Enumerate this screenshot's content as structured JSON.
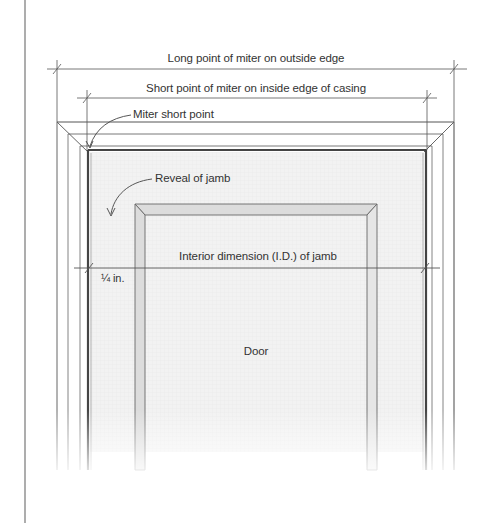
{
  "diagram": {
    "labels": {
      "long_point": "Long point of miter on outside edge",
      "short_point": "Short point of miter on inside edge of casing",
      "miter_short_point": "Miter short point",
      "reveal": "Reveal of jamb",
      "interior_dimension": "Interior dimension (I.D.) of jamb",
      "quarter_inch": "¼ in.",
      "door": "Door"
    },
    "colors": {
      "line": "#555555",
      "line_light": "#9a9a9a",
      "jamb_dark": "#444444",
      "door_fill": "#f1f1f1",
      "stop_fill": "#dcdcdc",
      "text": "#333333",
      "margin_rule": "#8a8a8a"
    }
  }
}
